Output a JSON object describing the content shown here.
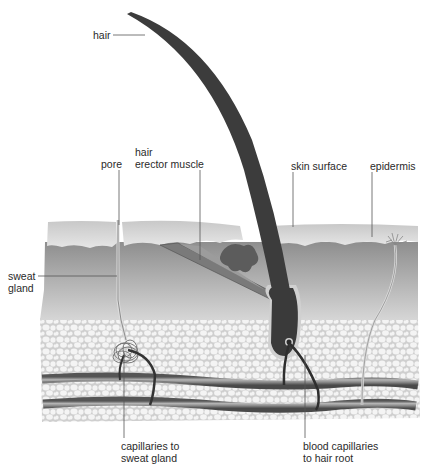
{
  "labels": {
    "hair": "hair",
    "pore": "pore",
    "hair_erector_muscle_1": "hair",
    "hair_erector_muscle_2": "erector muscle",
    "skin_surface": "skin surface",
    "epidermis": "epidermis",
    "sweat_gland_1": "sweat",
    "sweat_gland_2": "gland",
    "capillaries_sweat_1": "capillaries to",
    "capillaries_sweat_2": "sweat gland",
    "blood_capillaries_1": "blood capillaries",
    "blood_capillaries_2": "to hair root"
  },
  "colors": {
    "epidermis": "#d8d8d8",
    "dermis": "#9a9a9a",
    "fat": "#e8e8e8",
    "hair": "#3a3a3a",
    "vessel": "#6e6e6e"
  }
}
